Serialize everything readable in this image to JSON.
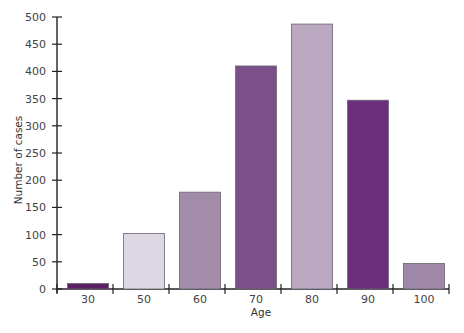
{
  "chart_data": {
    "type": "bar",
    "title": "",
    "xlabel": "Age",
    "ylabel": "Number of cases",
    "categories": [
      "30",
      "50",
      "60",
      "70",
      "80",
      "90",
      "100"
    ],
    "values": [
      10,
      102,
      178,
      410,
      487,
      347,
      47
    ],
    "colors": [
      "#5b1f63",
      "#dcd7e3",
      "#a28ca9",
      "#7b4f88",
      "#bba9c2",
      "#6c2f7b",
      "#9f88a7"
    ],
    "ylim": [
      0,
      500
    ],
    "yticks": [
      0,
      50,
      100,
      150,
      200,
      250,
      300,
      350,
      400,
      450,
      500
    ],
    "grid": false,
    "legend": null
  }
}
